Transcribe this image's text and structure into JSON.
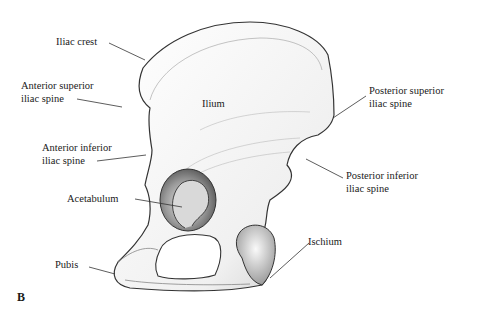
{
  "figure": {
    "panel_letter": "B",
    "labels": {
      "iliac_crest": "Iliac crest",
      "asis_line1": "Anterior superior",
      "asis_line2": "iliac spine",
      "ilium": "Ilium",
      "aiis_line1": "Anterior inferior",
      "aiis_line2": "iliac spine",
      "acetabulum": "Acetabulum",
      "pubis": "Pubis",
      "psis_line1": "Posterior superior",
      "psis_line2": "iliac spine",
      "piis_line1": "Posterior inferior",
      "piis_line2": "iliac spine",
      "ischium": "Ischium"
    },
    "colors": {
      "line": "#333333",
      "bone_light": "#f4f4f4",
      "bone_shade": "#8a8a8a",
      "text": "#1a1a1a"
    }
  }
}
